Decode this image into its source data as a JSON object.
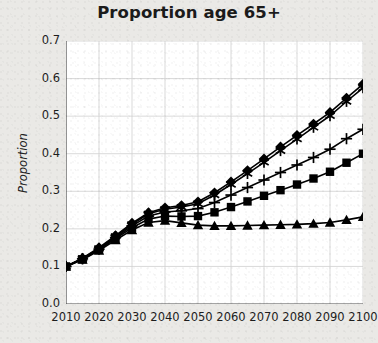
{
  "chart_data": {
    "type": "line",
    "title": "Proportion age 65+",
    "xlabel": "",
    "ylabel": "Proportion",
    "xlim": [
      2010,
      2100
    ],
    "ylim": [
      0.0,
      0.7
    ],
    "grid": true,
    "legend": "none",
    "xticks": [
      "2010",
      "2020",
      "2030",
      "2040",
      "2050",
      "2060",
      "2070",
      "2080",
      "2090",
      "2100"
    ],
    "yticks": [
      "0.0",
      "0.1",
      "0.2",
      "0.3",
      "0.4",
      "0.5",
      "0.6",
      "0.7"
    ],
    "x": [
      2010,
      2015,
      2020,
      2025,
      2030,
      2035,
      2040,
      2045,
      2050,
      2055,
      2060,
      2065,
      2070,
      2075,
      2080,
      2085,
      2090,
      2095,
      2100
    ],
    "series": [
      {
        "name": "Series 1",
        "marker": "diamond",
        "values": [
          0.1,
          0.122,
          0.15,
          0.182,
          0.215,
          0.243,
          0.256,
          0.262,
          0.272,
          0.296,
          0.325,
          0.355,
          0.386,
          0.418,
          0.449,
          0.479,
          0.51,
          0.548,
          0.585
        ]
      },
      {
        "name": "Series 2",
        "marker": "asterisk",
        "values": [
          0.1,
          0.121,
          0.148,
          0.18,
          0.212,
          0.24,
          0.252,
          0.258,
          0.267,
          0.29,
          0.318,
          0.347,
          0.377,
          0.408,
          0.439,
          0.47,
          0.501,
          0.539,
          0.575
        ]
      },
      {
        "name": "Series 3",
        "marker": "plus",
        "values": [
          0.1,
          0.12,
          0.146,
          0.177,
          0.208,
          0.234,
          0.245,
          0.248,
          0.254,
          0.27,
          0.29,
          0.31,
          0.33,
          0.35,
          0.37,
          0.39,
          0.412,
          0.44,
          0.465
        ]
      },
      {
        "name": "Series 4",
        "marker": "square",
        "values": [
          0.1,
          0.119,
          0.144,
          0.174,
          0.203,
          0.226,
          0.234,
          0.233,
          0.234,
          0.244,
          0.258,
          0.273,
          0.288,
          0.303,
          0.318,
          0.334,
          0.352,
          0.376,
          0.4
        ]
      },
      {
        "name": "Series 5",
        "marker": "triangle",
        "values": [
          0.1,
          0.118,
          0.142,
          0.17,
          0.197,
          0.217,
          0.222,
          0.216,
          0.21,
          0.208,
          0.208,
          0.209,
          0.21,
          0.211,
          0.212,
          0.214,
          0.217,
          0.224,
          0.232
        ]
      }
    ]
  }
}
